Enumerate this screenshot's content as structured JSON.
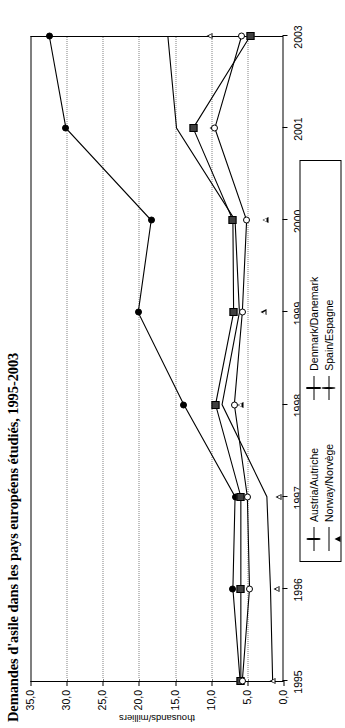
{
  "title": "Demandes d'asile dans les pays européens étudiés, 1995-2003",
  "axis": {
    "value_axis_title": "thousands/milliers",
    "value_ticks": [
      "35,0",
      "30,0",
      "25,0",
      "20,0",
      "15,0",
      "10,0",
      "5,0",
      "0,0"
    ],
    "year_ticks": [
      "1995",
      "1996",
      "1997",
      "1998",
      "1999",
      "2000",
      "2001",
      "2003"
    ]
  },
  "legend": {
    "entries": [
      {
        "label": "Austria/Autriche",
        "marker": "circle-filled"
      },
      {
        "label": "Norway/Norvège",
        "marker": "triangle-open"
      },
      {
        "label": "Denmark/Danemark",
        "marker": "square-filled"
      },
      {
        "label": "Spain/Espagne",
        "marker": "circle-open"
      }
    ]
  },
  "chart_data": {
    "type": "line",
    "title": "Demandes d'asile dans les pays européens étudiés, 1995-2003",
    "xlabel": "",
    "ylabel": "thousands/milliers",
    "x": [
      "1995",
      "1996",
      "1997",
      "1998",
      "1999",
      "2000",
      "2001",
      "2003"
    ],
    "ylim": [
      0.0,
      35.0
    ],
    "ytick_step": 5.0,
    "grid": "dotted-vertical-on-value-axis",
    "legend_position": "bottom-center",
    "orientation": "rotated-90-ccw",
    "series": [
      {
        "name": "Austria/Autriche",
        "marker": "circle-filled",
        "values": [
          6.0,
          7.0,
          6.7,
          13.8,
          20.1,
          18.3,
          30.1,
          32.4
        ]
      },
      {
        "name": "Norway/Norvège",
        "marker": "triangle-open",
        "values": [
          1.5,
          1.8,
          2.3,
          8.5,
          6.1,
          6.7,
          14.8,
          16.0
        ]
      },
      {
        "name": "Denmark/Danemark",
        "marker": "square-filled",
        "values": [
          5.9,
          5.9,
          5.9,
          9.4,
          6.9,
          7.0,
          12.5,
          4.6
        ]
      },
      {
        "name": "Spain/Espagne",
        "marker": "circle-open",
        "values": [
          5.7,
          4.7,
          5.0,
          6.8,
          5.7,
          5.1,
          9.5,
          5.8
        ]
      }
    ]
  }
}
